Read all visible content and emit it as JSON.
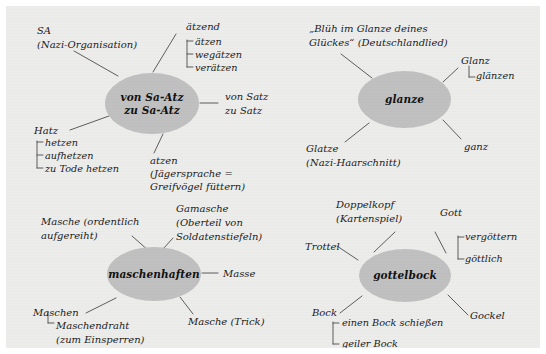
{
  "diagram": {
    "title_hidden": "",
    "background_color": "#ececeb",
    "node_color": "#c0c0c0",
    "line_color": "#555555",
    "clusters": [
      {
        "id": "cluster-sa-atz",
        "center": "von Sa-Atz\nzu Sa-Atz",
        "center_line1": "von Sa-Atz",
        "center_line2": "zu Sa-Atz",
        "branches": [
          {
            "name": "sa",
            "label": "SA",
            "note": "(Nazi-Organisation)",
            "sub": []
          },
          {
            "name": "aetzend",
            "label": "ätzend",
            "note": "",
            "sub": [
              "ätzen",
              "wegätzen",
              "verätzen"
            ]
          },
          {
            "name": "von-satz",
            "label": "von Satz",
            "note": "zu Satz",
            "sub": []
          },
          {
            "name": "atzen",
            "label": "atzen",
            "note": "(Jägersprache =",
            "note2": "Greifvögel füttern)",
            "sub": []
          },
          {
            "name": "hatz",
            "label": "Hatz",
            "note": "",
            "sub": [
              "hetzen",
              "aufhetzen",
              "zu Tode hetzen"
            ]
          }
        ]
      },
      {
        "id": "cluster-glanze",
        "center": "glanze",
        "branches": [
          {
            "name": "bluh",
            "label": "„Blüh im Glanze deines",
            "note": "Glückes“ (Deutschlandlied)",
            "sub": []
          },
          {
            "name": "glanz",
            "label": "Glanz",
            "note": "",
            "sub": [
              "glänzen"
            ]
          },
          {
            "name": "ganz",
            "label": "ganz",
            "note": "",
            "sub": []
          },
          {
            "name": "glatze",
            "label": "Glatze",
            "note": "(Nazi-Haarschnitt)",
            "sub": []
          }
        ]
      },
      {
        "id": "cluster-maschenhaften",
        "center": "maschenhaften",
        "branches": [
          {
            "name": "masche-ordentlich",
            "label": "Masche (ordentlich",
            "note": "aufgereiht)",
            "sub": []
          },
          {
            "name": "gamasche",
            "label": "Gamasche",
            "note": "(Oberteil von",
            "note2": "Soldatenstiefeln)",
            "sub": []
          },
          {
            "name": "masse",
            "label": "Masse",
            "note": "",
            "sub": []
          },
          {
            "name": "masche-trick",
            "label": "Masche (Trick)",
            "note": "",
            "sub": []
          },
          {
            "name": "maschen",
            "label": "Maschen",
            "note": "",
            "sub": [
              "Maschendraht",
              "(zum Einsperren)"
            ]
          }
        ]
      },
      {
        "id": "cluster-gottelbock",
        "center": "gottelbock",
        "branches": [
          {
            "name": "doppelkopf",
            "label": "Doppelkopf",
            "note": "(Kartenspiel)",
            "sub": []
          },
          {
            "name": "gott",
            "label": "Gott",
            "note": "",
            "sub": [
              "vergöttern",
              "göttlich"
            ]
          },
          {
            "name": "trottel",
            "label": "Trottel",
            "note": "",
            "sub": []
          },
          {
            "name": "gockel",
            "label": "Gockel",
            "note": "",
            "sub": []
          },
          {
            "name": "bock",
            "label": "Bock",
            "note": "",
            "sub": [
              "einen Bock schießen",
              "geiler Bock"
            ]
          }
        ]
      }
    ]
  },
  "labels": {
    "sa": "SA",
    "sa_note": "(Nazi-Organisation)",
    "aetzend": "ätzend",
    "aetzen": "ätzen",
    "wegaetzen": "wegätzen",
    "veraetzen": "verätzen",
    "center1_l1": "von Sa-Atz",
    "center1_l2": "zu Sa-Atz",
    "von_satz": "von Satz",
    "zu_satz": "zu Satz",
    "hatz": "Hatz",
    "hetzen": "hetzen",
    "aufhetzen": "aufhetzen",
    "zu_tode_hetzen": "zu Tode hetzen",
    "atzen": "atzen",
    "jaegersprache": "(Jägersprache =",
    "greifvoegel": "Greifvögel füttern)",
    "bluh1": "„Blüh im Glanze deines",
    "bluh2": "Glückes“ (Deutschlandlied)",
    "glanz": "Glanz",
    "glaenzen": "glänzen",
    "center2": "glanze",
    "ganz": "ganz",
    "glatze": "Glatze",
    "glatze_note": "(Nazi-Haarschnitt)",
    "masche_ordentlich": "Masche (ordentlich",
    "aufgereiht": "aufgereiht)",
    "gamasche": "Gamasche",
    "oberteil_von": "(Oberteil von",
    "soldatenstiefeln": "Soldatenstiefeln)",
    "center3": "maschenhaften",
    "masse": "Masse",
    "maschen": "Maschen",
    "maschendraht": "Maschendraht",
    "zum_einsperren": "(zum Einsperren)",
    "masche_trick": "Masche (Trick)",
    "doppelkopf": "Doppelkopf",
    "kartenspiel": "(Kartenspiel)",
    "gott": "Gott",
    "vergoettern": "vergöttern",
    "goettlich": "göttlich",
    "trottel": "Trottel",
    "center4": "gottelbock",
    "gockel": "Gockel",
    "bock": "Bock",
    "einen_bock": "einen Bock schießen",
    "geiler_bock": "geiler Bock"
  }
}
